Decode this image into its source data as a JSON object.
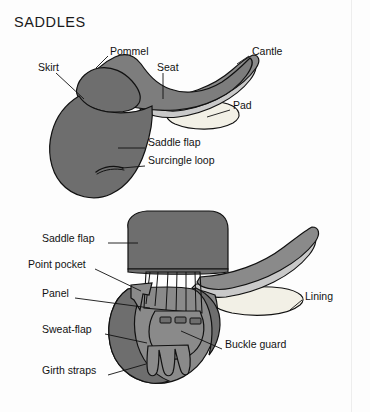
{
  "figure": {
    "title": "SADDLES",
    "background_color": "#fdfdfd",
    "ink_color": "#121212"
  },
  "palette": {
    "dark_gray": "#6e6e6e",
    "mid_gray": "#8a8a8a",
    "light_gray": "#a8a8a8",
    "pale_gray": "#c9c9c9",
    "cream": "#f2f0e6",
    "outline": "#111111",
    "page_edge": "#ededed"
  },
  "diagrams": [
    {
      "name": "side-view-saddle",
      "labels": [
        {
          "id": "pommel",
          "text": "Pommel",
          "x": 110,
          "y": 52,
          "align": "left"
        },
        {
          "id": "cantle",
          "text": "Cantle",
          "x": 252,
          "y": 52,
          "align": "left"
        },
        {
          "id": "skirt",
          "text": "Skirt",
          "x": 38,
          "y": 68,
          "align": "left"
        },
        {
          "id": "seat",
          "text": "Seat",
          "x": 157,
          "y": 68,
          "align": "left"
        },
        {
          "id": "pad",
          "text": "Pad",
          "x": 233,
          "y": 106,
          "align": "left"
        },
        {
          "id": "saddle-flap",
          "text": "Saddle flap",
          "x": 148,
          "y": 143,
          "align": "left"
        },
        {
          "id": "surcingle-loop",
          "text": "Surcingle loop",
          "x": 148,
          "y": 161,
          "align": "left"
        }
      ]
    },
    {
      "name": "underside-view-saddle",
      "labels": [
        {
          "id": "saddle-flap-2",
          "text": "Saddle flap",
          "x": 42,
          "y": 239,
          "align": "left"
        },
        {
          "id": "point-pocket",
          "text": "Point pocket",
          "x": 30,
          "y": 265,
          "align": "left"
        },
        {
          "id": "panel",
          "text": "Panel",
          "x": 42,
          "y": 294,
          "align": "left"
        },
        {
          "id": "lining",
          "text": "Lining",
          "x": 305,
          "y": 297,
          "align": "left"
        },
        {
          "id": "sweat-flap",
          "text": "Sweat-flap",
          "x": 42,
          "y": 330,
          "align": "left"
        },
        {
          "id": "buckle-guard",
          "text": "Buckle guard",
          "x": 225,
          "y": 345,
          "align": "left"
        },
        {
          "id": "girth-straps",
          "text": "Girth straps",
          "x": 42,
          "y": 371,
          "align": "left"
        }
      ]
    }
  ]
}
